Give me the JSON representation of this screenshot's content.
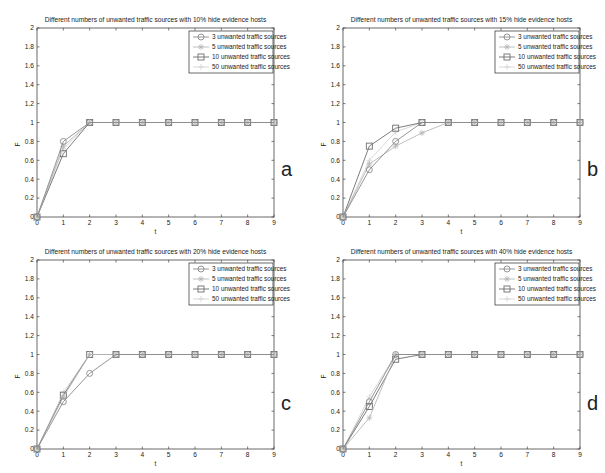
{
  "figure": {
    "panels": [
      {
        "letter": "a",
        "title": "Different numbers of unwanted traffic sources with 10% hide evidence hosts"
      },
      {
        "letter": "b",
        "title": "Different numbers of unwanted traffic sources with 15% hide evidence hosts"
      },
      {
        "letter": "c",
        "title": "Different numbers of unwanted traffic sources with 20% hide evidence hosts"
      },
      {
        "letter": "d",
        "title": "Different numbers of unwanted traffic sources with 40% hide evidence hosts"
      }
    ],
    "legend": [
      "3 unwanted traffic sources",
      "5 unwanted traffic sources",
      "10 unwanted traffic sources",
      "50 unwanted traffic sources"
    ],
    "xlabel": "t",
    "ylabel": "F",
    "colors": {
      "s3": "#8a8a8a",
      "s5": "#b8b8b8",
      "s10": "#6e6e6e",
      "s50": "#d4d4d4",
      "axis": "#444444",
      "text": "#222222"
    }
  },
  "chart_data": [
    {
      "type": "line",
      "title": "Different numbers of unwanted traffic sources with 10% hide evidence hosts",
      "xlabel": "t",
      "ylabel": "F",
      "x": [
        0,
        1,
        2,
        3,
        4,
        5,
        6,
        7,
        8,
        9
      ],
      "xlim": [
        0,
        9
      ],
      "ylim": [
        0,
        2
      ],
      "yticks": [
        0,
        0.2,
        0.4,
        0.6,
        0.8,
        1,
        1.2,
        1.4,
        1.6,
        1.8,
        2
      ],
      "legend_position": "upper right",
      "series": [
        {
          "name": "3 unwanted traffic sources",
          "marker": "circle",
          "values": [
            0,
            0.8,
            1,
            1,
            1,
            1,
            1,
            1,
            1,
            1
          ]
        },
        {
          "name": "5 unwanted traffic sources",
          "marker": "star",
          "values": [
            0,
            0.75,
            1,
            1,
            1,
            1,
            1,
            1,
            1,
            1
          ]
        },
        {
          "name": "10 unwanted traffic sources",
          "marker": "square",
          "values": [
            0,
            0.67,
            1,
            1,
            1,
            1,
            1,
            1,
            1,
            1
          ]
        },
        {
          "name": "50 unwanted traffic sources",
          "marker": "plus",
          "values": [
            0,
            0.72,
            1,
            1,
            1,
            1,
            1,
            1,
            1,
            1
          ]
        }
      ]
    },
    {
      "type": "line",
      "title": "Different numbers of unwanted traffic sources with 15% hide evidence hosts",
      "xlabel": "t",
      "ylabel": "F",
      "x": [
        0,
        1,
        2,
        3,
        4,
        5,
        6,
        7,
        8,
        9
      ],
      "xlim": [
        0,
        9
      ],
      "ylim": [
        0,
        2
      ],
      "yticks": [
        0,
        0.2,
        0.4,
        0.6,
        0.8,
        1,
        1.2,
        1.4,
        1.6,
        1.8,
        2
      ],
      "legend_position": "upper right",
      "series": [
        {
          "name": "3 unwanted traffic sources",
          "marker": "circle",
          "values": [
            0,
            0.5,
            0.8,
            1,
            1,
            1,
            1,
            1,
            1,
            1
          ]
        },
        {
          "name": "5 unwanted traffic sources",
          "marker": "star",
          "values": [
            0,
            0.56,
            0.75,
            0.89,
            1,
            1,
            1,
            1,
            1,
            1
          ]
        },
        {
          "name": "10 unwanted traffic sources",
          "marker": "square",
          "values": [
            0,
            0.75,
            0.94,
            1,
            1,
            1,
            1,
            1,
            1,
            1
          ]
        },
        {
          "name": "50 unwanted traffic sources",
          "marker": "plus",
          "values": [
            0,
            0.6,
            0.9,
            1,
            1,
            1,
            1,
            1,
            1,
            1
          ]
        }
      ]
    },
    {
      "type": "line",
      "title": "Different numbers of unwanted traffic sources with 20% hide evidence hosts",
      "xlabel": "t",
      "ylabel": "F",
      "x": [
        0,
        1,
        2,
        3,
        4,
        5,
        6,
        7,
        8,
        9
      ],
      "xlim": [
        0,
        9
      ],
      "ylim": [
        0,
        2
      ],
      "yticks": [
        0,
        0.2,
        0.4,
        0.6,
        0.8,
        1,
        1.2,
        1.4,
        1.6,
        1.8,
        2
      ],
      "legend_position": "upper right",
      "series": [
        {
          "name": "3 unwanted traffic sources",
          "marker": "circle",
          "values": [
            0,
            0.5,
            0.8,
            1,
            1,
            1,
            1,
            1,
            1,
            1
          ]
        },
        {
          "name": "5 unwanted traffic sources",
          "marker": "star",
          "values": [
            0,
            0.55,
            1,
            1,
            1,
            1,
            1,
            1,
            1,
            1
          ]
        },
        {
          "name": "10 unwanted traffic sources",
          "marker": "square",
          "values": [
            0,
            0.57,
            1,
            1,
            1,
            1,
            1,
            1,
            1,
            1
          ]
        },
        {
          "name": "50 unwanted traffic sources",
          "marker": "plus",
          "values": [
            0,
            0.6,
            1,
            1,
            1,
            1,
            1,
            1,
            1,
            1
          ]
        }
      ]
    },
    {
      "type": "line",
      "title": "Different numbers of unwanted traffic sources with 40% hide evidence hosts",
      "xlabel": "t",
      "ylabel": "F",
      "x": [
        0,
        1,
        2,
        3,
        4,
        5,
        6,
        7,
        8,
        9
      ],
      "xlim": [
        0,
        9
      ],
      "ylim": [
        0,
        2
      ],
      "yticks": [
        0,
        0.2,
        0.4,
        0.6,
        0.8,
        1,
        1.2,
        1.4,
        1.6,
        1.8,
        2
      ],
      "legend_position": "upper right",
      "series": [
        {
          "name": "3 unwanted traffic sources",
          "marker": "circle",
          "values": [
            0,
            0.5,
            1,
            1,
            1,
            1,
            1,
            1,
            1,
            1
          ]
        },
        {
          "name": "5 unwanted traffic sources",
          "marker": "star",
          "values": [
            0,
            0.33,
            1,
            1,
            1,
            1,
            1,
            1,
            1,
            1
          ]
        },
        {
          "name": "10 unwanted traffic sources",
          "marker": "square",
          "values": [
            0,
            0.45,
            0.95,
            1,
            1,
            1,
            1,
            1,
            1,
            1
          ]
        },
        {
          "name": "50 unwanted traffic sources",
          "marker": "plus",
          "values": [
            0,
            0.55,
            1,
            1,
            1,
            1,
            1,
            1,
            1,
            1
          ]
        }
      ]
    }
  ]
}
